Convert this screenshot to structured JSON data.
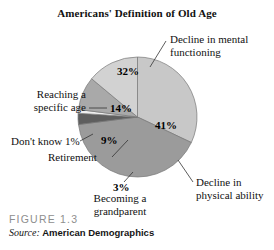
{
  "figure": {
    "title": "Americans' Definition of Old Age",
    "caption_number": "FIGURE 1.3",
    "source_label": "Source:",
    "source_name": "American Demographics"
  },
  "chart_data": {
    "type": "pie",
    "title": "Americans' Definition of Old Age",
    "xlabel": "",
    "ylabel": "",
    "legend": "none",
    "grid": false,
    "units": "percent",
    "start_angle_deg": -90,
    "direction": "clockwise",
    "categories": [
      "Decline in mental functioning",
      "Decline in physical ability",
      "Becoming a grandparent",
      "Don't know",
      "Retirement",
      "Reaching a specific age"
    ],
    "values": [
      32,
      41,
      3,
      1,
      9,
      14
    ],
    "value_labels": [
      "32%",
      "41%",
      "3%",
      "1%",
      "9%",
      "14%"
    ],
    "colors": [
      "#c8c8c8",
      "#9b9b9b",
      "#5e5e5e",
      "#efefef",
      "#a9a9a9",
      "#d2d2d2"
    ],
    "slices": [
      {
        "name": "decline-in-mental-functioning",
        "label": "Decline in mental functioning",
        "value": 32,
        "value_label": "32%",
        "color": "#c8c8c8"
      },
      {
        "name": "decline-in-physical-ability",
        "label": "Decline in physical ability",
        "value": 41,
        "value_label": "41%",
        "color": "#9b9b9b"
      },
      {
        "name": "becoming-a-grandparent",
        "label": "Becoming a grandparent",
        "value": 3,
        "value_label": "3%",
        "color": "#5e5e5e"
      },
      {
        "name": "dont-know",
        "label": "Don't know",
        "value": 1,
        "value_label": "1%",
        "color": "#efefef"
      },
      {
        "name": "retirement",
        "label": "Retirement",
        "value": 9,
        "value_label": "9%",
        "color": "#a9a9a9"
      },
      {
        "name": "reaching-a-specific-age",
        "label": "Reaching a specific age",
        "value": 14,
        "value_label": "14%",
        "color": "#d2d2d2"
      }
    ]
  },
  "callouts": {
    "mental_line1": "Decline in mental",
    "mental_line2": "functioning",
    "physical_line1": "Decline in",
    "physical_line2": "physical ability",
    "reaching_line1": "Reaching a",
    "reaching_line2": "specific age",
    "dont_know": "Don't know 1%",
    "retirement": "Retirement",
    "grandparent_line1": "Becoming a",
    "grandparent_line2": "grandparent"
  },
  "value_labels": {
    "mental": "32%",
    "physical": "41%",
    "reaching": "14%",
    "retirement": "9%",
    "grandparent": "3%"
  }
}
